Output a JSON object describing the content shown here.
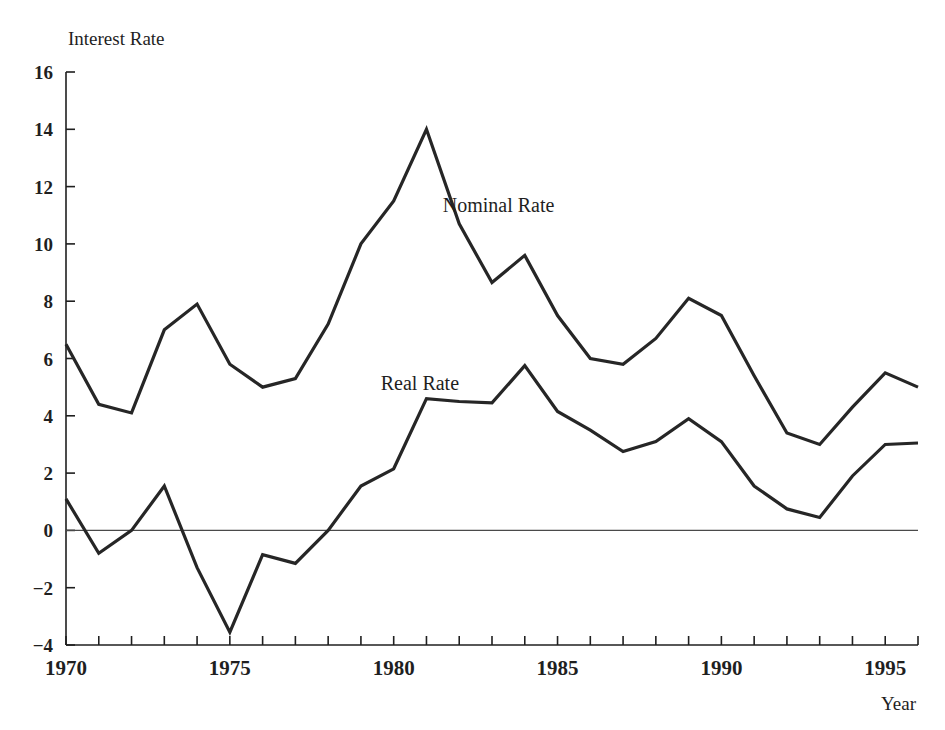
{
  "chart_data": {
    "type": "line",
    "title": "",
    "ylabel": "Interest Rate",
    "xlabel": "Year",
    "xlim": [
      1970,
      1996
    ],
    "ylim": [
      -4,
      16
    ],
    "yticks": [
      -4,
      -2,
      0,
      2,
      4,
      6,
      8,
      10,
      12,
      14,
      16
    ],
    "ytick_labels": [
      "−4",
      "−2",
      "0",
      "2",
      "4",
      "6",
      "8",
      "10",
      "12",
      "14",
      "16"
    ],
    "xticks": [
      1970,
      1971,
      1972,
      1973,
      1974,
      1975,
      1976,
      1977,
      1978,
      1979,
      1980,
      1981,
      1982,
      1983,
      1984,
      1985,
      1986,
      1987,
      1988,
      1989,
      1990,
      1991,
      1992,
      1993,
      1994,
      1995,
      1996
    ],
    "xtick_labels_shown": [
      "1970",
      "1975",
      "1980",
      "1985",
      "1990",
      "1995"
    ],
    "xtick_label_years": [
      1970,
      1975,
      1980,
      1985,
      1990,
      1995
    ],
    "grid": false,
    "legend": "inline-annotations",
    "zero_line": true,
    "x": [
      1970,
      1971,
      1972,
      1973,
      1974,
      1975,
      1976,
      1977,
      1978,
      1979,
      1980,
      1981,
      1982,
      1983,
      1984,
      1985,
      1986,
      1987,
      1988,
      1989,
      1990,
      1991,
      1992,
      1993,
      1994,
      1995,
      1996
    ],
    "series": [
      {
        "name": "Nominal Rate",
        "label_x": 1983.2,
        "label_y": 11.1,
        "values": [
          6.5,
          4.4,
          4.1,
          7.0,
          7.9,
          5.8,
          5.0,
          5.3,
          7.2,
          10.0,
          11.5,
          14.0,
          10.7,
          8.65,
          9.6,
          7.5,
          6.0,
          5.8,
          6.7,
          8.1,
          7.5,
          5.4,
          3.4,
          3.0,
          4.3,
          5.5,
          5.0
        ]
      },
      {
        "name": "Real Rate",
        "label_x": 1980.8,
        "label_y": 4.9,
        "values": [
          1.1,
          -0.8,
          0.0,
          1.55,
          -1.3,
          -3.55,
          -0.85,
          -1.15,
          0.0,
          1.55,
          2.15,
          4.6,
          4.5,
          4.45,
          5.75,
          4.15,
          3.5,
          2.75,
          3.1,
          3.9,
          3.1,
          1.55,
          0.75,
          0.45,
          1.9,
          3.0,
          3.05
        ]
      }
    ]
  },
  "axes": {
    "y_axis_title": "Interest Rate",
    "x_axis_title": "Year"
  }
}
